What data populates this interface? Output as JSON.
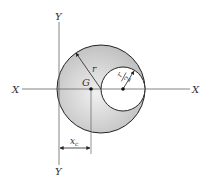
{
  "diagram": {
    "axes": {
      "x_left_label": "X",
      "x_right_label": "X",
      "y_top_label": "Y",
      "y_bottom_label": "Y"
    },
    "labels": {
      "centroid": "G",
      "big_radius": "r",
      "small_radius_num": "r",
      "small_radius_den": "2",
      "centroid_distance": "x",
      "centroid_distance_sub": "c"
    },
    "colors": {
      "shaded_region": "#c8c8c8",
      "shaded_light": "#eeeeee",
      "stroke": "#222222",
      "axis": "#555555",
      "background": "#ffffff"
    }
  }
}
